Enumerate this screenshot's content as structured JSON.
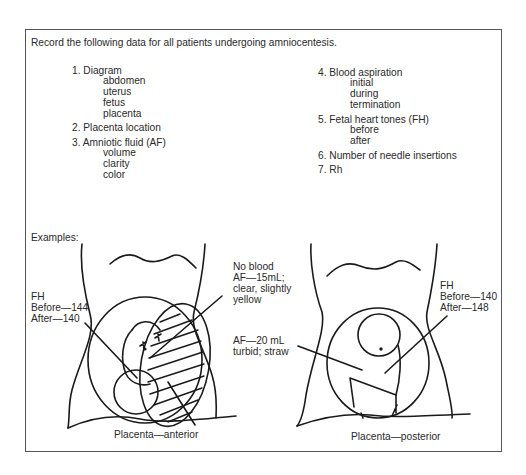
{
  "intro": "Record the following data for all patients undergoing amniocentesis.",
  "left_list": [
    {
      "label": "1. Diagram",
      "subitems": [
        "abdomen",
        "uterus",
        "fetus",
        "placenta"
      ]
    },
    {
      "label": "2. Placenta location",
      "subitems": []
    },
    {
      "label": "3. Amniotic fluid (AF)",
      "subitems": [
        "volume",
        "clarity",
        "color"
      ]
    }
  ],
  "right_list": [
    {
      "label": "4. Blood aspiration",
      "subitems": [
        "initial",
        "during",
        "termination"
      ]
    },
    {
      "label": "5. Fetal heart tones (FH)",
      "subitems": [
        "before",
        "after"
      ]
    },
    {
      "label": "6. Number of needle insertions",
      "subitems": []
    },
    {
      "label": "7. Rh",
      "subitems": []
    }
  ],
  "examples_label": "Examples:",
  "example_anterior": {
    "fh_lines": [
      "FH",
      "Before—144",
      "After—140"
    ],
    "note1_lines": [
      "No blood",
      "AF—15mL;",
      "clear, slightly",
      "yellow"
    ],
    "caption": "Placenta—anterior"
  },
  "example_posterior": {
    "af_lines": [
      "AF—20 mL",
      "turbid; straw"
    ],
    "fh_lines": [
      "FH",
      "Before—140",
      "After—148"
    ],
    "caption": "Placenta—posterior"
  },
  "colors": {
    "ink": "#1a1a1a",
    "frame": "#555555",
    "background": "#ffffff"
  }
}
